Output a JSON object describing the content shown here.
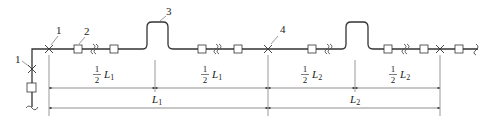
{
  "diagram": {
    "type": "pipeline-compensator-layout",
    "callouts": [
      {
        "id": "c1a",
        "label": "1",
        "x": 47,
        "y": 23,
        "target_x": 49,
        "target_y": 49
      },
      {
        "id": "c1b",
        "label": "1",
        "x": 15,
        "y": 61,
        "target_x": 32,
        "target_y": 69
      },
      {
        "id": "c2",
        "label": "2",
        "x": 84,
        "y": 33,
        "target_x": 78,
        "target_y": 46
      },
      {
        "id": "c3",
        "label": "3",
        "x": 168,
        "y": 15,
        "target_x": 160,
        "target_y": 22
      },
      {
        "id": "c4",
        "label": "4",
        "x": 283,
        "y": 28,
        "target_x": 270,
        "target_y": 46
      }
    ],
    "dimensions": {
      "row1": [
        {
          "numerator": "1",
          "denominator": "2",
          "var": "L",
          "sub": "1",
          "x_from": 49,
          "x_to": 155
        },
        {
          "numerator": "1",
          "denominator": "2",
          "var": "L",
          "sub": "1",
          "x_from": 155,
          "x_to": 268
        },
        {
          "numerator": "1",
          "denominator": "2",
          "var": "L",
          "sub": "2",
          "x_from": 268,
          "x_to": 355
        },
        {
          "numerator": "1",
          "denominator": "2",
          "var": "L",
          "sub": "2",
          "x_from": 355,
          "x_to": 440
        }
      ],
      "row2": [
        {
          "var": "L",
          "sub": "1",
          "x_from": 49,
          "x_to": 268
        },
        {
          "var": "L",
          "sub": "2",
          "x_from": 268,
          "x_to": 440
        }
      ]
    },
    "legend_meaning": {
      "1": "fixed support (anchor)",
      "2": "sliding support",
      "3": "expansion loop (compensator)",
      "4": "fixed support"
    }
  }
}
